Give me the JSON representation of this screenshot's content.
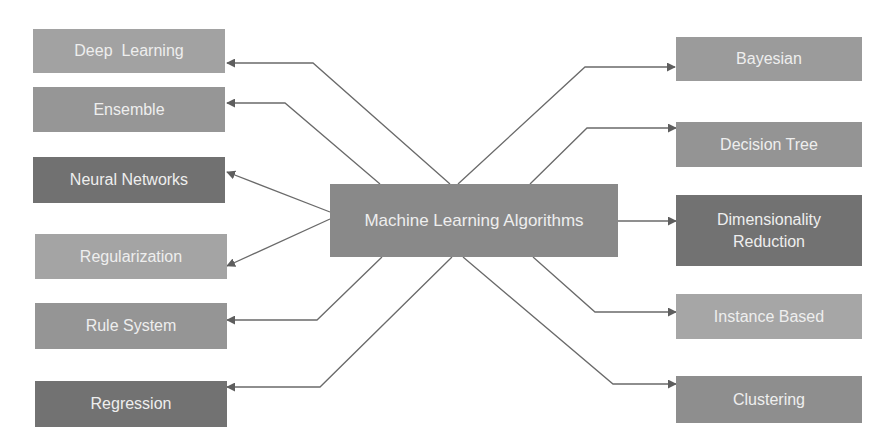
{
  "diagram": {
    "center": {
      "label": "Machine Learning Algorithms"
    },
    "left_nodes": [
      {
        "id": "deep-learning",
        "label": "Deep  Learning",
        "color": "#a2a2a2"
      },
      {
        "id": "ensemble",
        "label": "Ensemble",
        "color": "#969696"
      },
      {
        "id": "neural-networks",
        "label": "Neural Networks",
        "color": "#717171"
      },
      {
        "id": "regularization",
        "label": "Regularization",
        "color": "#a4a4a4"
      },
      {
        "id": "rule-system",
        "label": "Rule System",
        "color": "#959595"
      },
      {
        "id": "regression",
        "label": "Regression",
        "color": "#727272"
      }
    ],
    "right_nodes": [
      {
        "id": "bayesian",
        "label": "Bayesian",
        "color": "#9b9b9b"
      },
      {
        "id": "decision-tree",
        "label": "Decision Tree",
        "color": "#949494"
      },
      {
        "id": "dimensionality-reduction",
        "label": "Dimensionality\nReduction",
        "color": "#727272"
      },
      {
        "id": "instance-based",
        "label": "Instance Based",
        "color": "#a6a6a6"
      },
      {
        "id": "clustering",
        "label": "Clustering",
        "color": "#8e8e8e"
      }
    ],
    "edges": [
      {
        "from": "Machine Learning Algorithms",
        "to": "Deep  Learning"
      },
      {
        "from": "Machine Learning Algorithms",
        "to": "Ensemble"
      },
      {
        "from": "Machine Learning Algorithms",
        "to": "Neural Networks"
      },
      {
        "from": "Machine Learning Algorithms",
        "to": "Regularization"
      },
      {
        "from": "Machine Learning Algorithms",
        "to": "Rule System"
      },
      {
        "from": "Machine Learning Algorithms",
        "to": "Regression"
      },
      {
        "from": "Machine Learning Algorithms",
        "to": "Bayesian"
      },
      {
        "from": "Machine Learning Algorithms",
        "to": "Decision Tree"
      },
      {
        "from": "Machine Learning Algorithms",
        "to": "Dimensionality Reduction"
      },
      {
        "from": "Machine Learning Algorithms",
        "to": "Instance Based"
      },
      {
        "from": "Machine Learning Algorithms",
        "to": "Clustering"
      }
    ],
    "colors": {
      "center": "#898989",
      "edge": "#6a6a6a",
      "text": "#eeeeee",
      "background": "#ffffff"
    }
  }
}
